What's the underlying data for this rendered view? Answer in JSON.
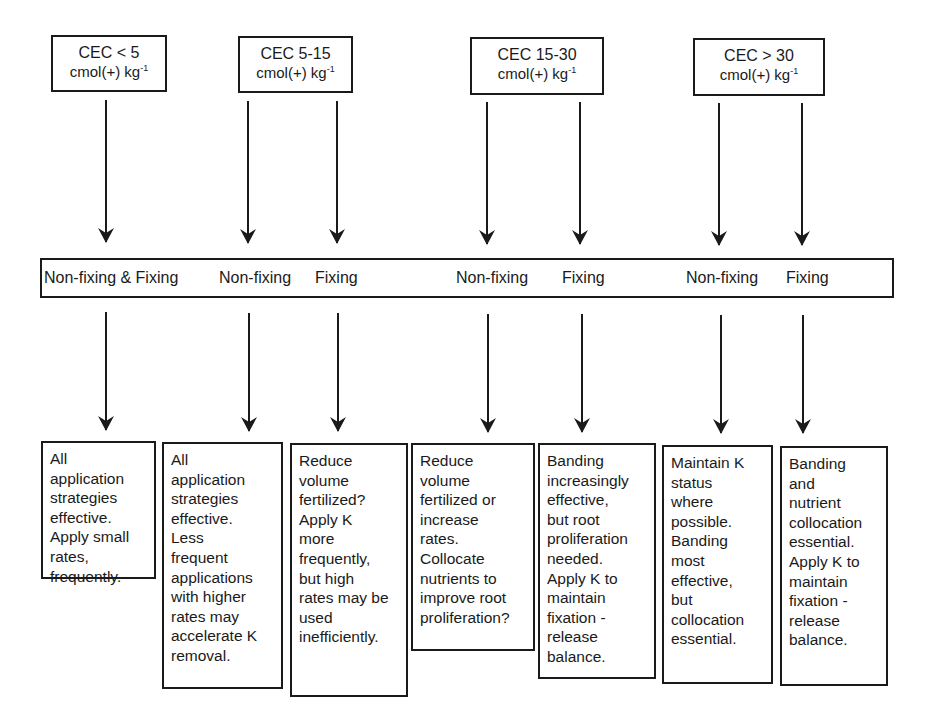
{
  "diagram": {
    "cec_categories": [
      {
        "label": "CEC < 5",
        "unit": "cmol(+) kg",
        "exp": "-1"
      },
      {
        "label": "CEC 5-15",
        "unit": "cmol(+) kg",
        "exp": "-1"
      },
      {
        "label": "CEC 15-30",
        "unit": "cmol(+) kg",
        "exp": "-1"
      },
      {
        "label": "CEC > 30",
        "unit": "cmol(+) kg",
        "exp": "-1"
      }
    ],
    "clay_types": [
      "Non-fixing & Fixing",
      "Non-fixing",
      "Fixing",
      "Non-fixing",
      "Fixing",
      "Non-fixing",
      "Fixing"
    ],
    "recommendations": [
      "All\napplication\nstrategies\neffective.\nApply small\nrates,\nfrequently.",
      "All\napplication\nstrategies\neffective.\nLess\nfrequent\napplications\nwith higher\nrates may\naccelerate K\nremoval.",
      "Reduce\nvolume\nfertilized?\nApply K\nmore\nfrequently,\nbut high\nrates may be\nused\ninefficiently.",
      "Reduce\nvolume\nfertilized or\nincrease\nrates.\nCollocate\nnutrients to\nimprove root\nproliferation?",
      "Banding\nincreasingly\neffective,\nbut root\nproliferation\nneeded.\nApply K to\nmaintain\nfixation -\nrelease\nbalance.",
      "Maintain K\nstatus\nwhere\npossible.\nBanding\nmost\neffective,\nbut\ncollocation\nessential.",
      "Banding\nand\nnutrient\ncollocation\nessential.\nApply K to\nmaintain\nfixation -\nrelease\nbalance."
    ],
    "colors": {
      "line": "#1a1a1a",
      "background": "#ffffff"
    }
  }
}
